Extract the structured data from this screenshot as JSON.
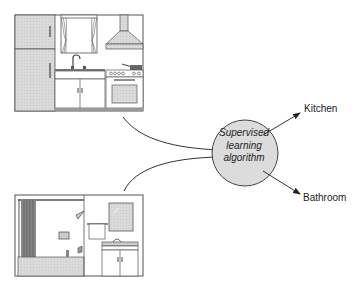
{
  "diagram": {
    "inputs": [
      {
        "name": "kitchen-image",
        "description": "Kitchen illustration: refrigerator, window with curtains, sink with faucet, range hood, stove with oven"
      },
      {
        "name": "bathroom-image",
        "description": "Bathroom illustration: bathtub with shower curtain, shower head, towel rack, mirror, vanity sink cabinet"
      }
    ],
    "algorithm": {
      "line1": "Supervised",
      "line2": "learning",
      "line3": "algorithm"
    },
    "outputs": {
      "kitchen": "Kitchen",
      "bathroom": "Bathroom"
    },
    "colors": {
      "circle_fill": "#dcdcdc",
      "stroke": "#333333",
      "appliance_fill": "#d9d9d9"
    }
  }
}
